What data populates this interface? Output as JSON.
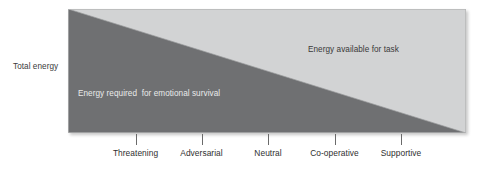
{
  "figure": {
    "y_axis_caption": "Total energy",
    "region_labels": {
      "lower": "Energy required  for emotional survival",
      "upper": "Energy available for task"
    }
  },
  "chart_data": {
    "type": "area",
    "title": "",
    "subtitle": "",
    "xlabel": "",
    "ylabel": "Total energy",
    "grid": false,
    "legend": "none",
    "annotations": [
      "Energy required  for emotional survival",
      "Energy available for task"
    ],
    "categories": [
      "Threatening",
      "Adversarial",
      "Neutral",
      "Co-operative",
      "Supportive"
    ],
    "x": [
      1,
      2,
      3,
      4,
      5
    ],
    "ylim": [
      0,
      100
    ],
    "series": [
      {
        "name": "Energy required  for emotional survival",
        "color": "#6f7072",
        "values": [
          100,
          75,
          50,
          25,
          0
        ]
      },
      {
        "name": "Energy available for task",
        "color": "#d2d3d4",
        "values": [
          0,
          25,
          50,
          75,
          100
        ]
      }
    ],
    "colors": {
      "lower_region": "#6f7072",
      "upper_region": "#d2d3d4",
      "panel_border": "#b4b5b6",
      "tick": "#6a6a6a",
      "text_dark": "#2f2f2f",
      "text_light": "#e9eaea"
    }
  }
}
